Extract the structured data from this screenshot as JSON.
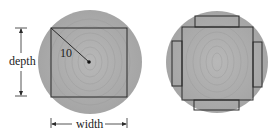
{
  "diagram": {
    "left_figure": {
      "radius_label": "10",
      "depth_label": "depth",
      "width_label": "width"
    },
    "colors": {
      "log_fill": "#a9a9a9",
      "log_ring": "#9c9c9c",
      "line": "#2a2a2a",
      "text": "#222222"
    }
  }
}
